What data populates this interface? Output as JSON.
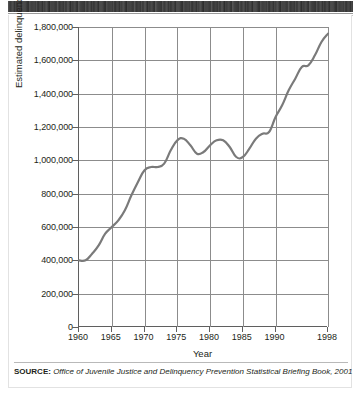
{
  "figure": {
    "top_band_note": "dark scan band (cut-off header)",
    "source_prefix": "SOURCE:",
    "source_text": "Office of Juvenile Justice and Delinquency Prevention Statistical Briefing Book, 2001"
  },
  "chart_data": {
    "type": "line",
    "title": "",
    "xlabel": "Year",
    "ylabel": "Estimated delinquency cases",
    "xlim": [
      1960,
      1998
    ],
    "ylim": [
      0,
      1800000
    ],
    "grid": true,
    "legend": "none",
    "line_color": "#7a7a7a",
    "ytick_labels": [
      "0",
      "200,000",
      "400,000",
      "600,000",
      "800,000",
      "1,000,000",
      "1,200,000",
      "1,400,000",
      "1,600,000",
      "1,800,000"
    ],
    "ytick_values": [
      0,
      200000,
      400000,
      600000,
      800000,
      1000000,
      1200000,
      1400000,
      1600000,
      1800000
    ],
    "xtick_labels": [
      "1960",
      "1965",
      "1970",
      "1975",
      "1980",
      "1985",
      "1990",
      "1998"
    ],
    "xtick_values": [
      1960,
      1965,
      1970,
      1975,
      1980,
      1985,
      1990,
      1998
    ],
    "x": [
      1960,
      1961,
      1962,
      1963,
      1964,
      1965,
      1966,
      1967,
      1968,
      1969,
      1970,
      1971,
      1972,
      1973,
      1974,
      1975,
      1976,
      1977,
      1978,
      1979,
      1980,
      1981,
      1982,
      1983,
      1984,
      1985,
      1986,
      1987,
      1988,
      1989,
      1990,
      1991,
      1992,
      1993,
      1994,
      1995,
      1996,
      1997,
      1998
    ],
    "values": [
      400000,
      400000,
      440000,
      490000,
      560000,
      600000,
      640000,
      700000,
      790000,
      870000,
      940000,
      960000,
      960000,
      980000,
      1060000,
      1120000,
      1130000,
      1090000,
      1040000,
      1050000,
      1090000,
      1120000,
      1120000,
      1080000,
      1020000,
      1020000,
      1070000,
      1130000,
      1160000,
      1170000,
      1260000,
      1330000,
      1420000,
      1490000,
      1560000,
      1570000,
      1630000,
      1710000,
      1760000
    ]
  }
}
